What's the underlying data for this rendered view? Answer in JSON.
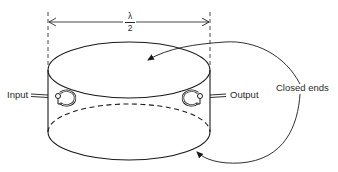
{
  "diagram": {
    "type": "cavity-resonator",
    "dimension": {
      "numerator": "λ",
      "denominator": "2"
    },
    "labels": {
      "input": "Input",
      "output": "Output",
      "closed_ends": "Closed ends"
    },
    "colors": {
      "stroke": "#1a1a1a",
      "text": "#2a2a2a",
      "background": "#ffffff"
    }
  }
}
